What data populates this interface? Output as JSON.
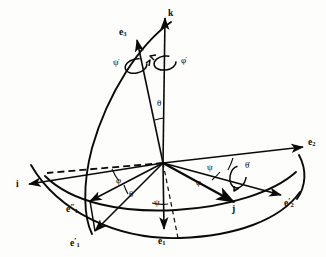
{
  "figure": {
    "background_color": "#fdfdfb",
    "ink_color": "#0a0a0a"
  },
  "labels": {
    "k": {
      "text": "k",
      "sub": ""
    },
    "e3": {
      "text": "e",
      "sub": "3"
    },
    "e2": {
      "text": "e",
      "sub": "2"
    },
    "e1": {
      "text": "e",
      "sub": "1"
    },
    "e1_prime": {
      "text": "e",
      "prime": "′",
      "sub": "1"
    },
    "e1_dprime": {
      "text": "e",
      "prime": "″",
      "sub": "1"
    },
    "e2_prime": {
      "text": "e",
      "prime": "′",
      "sub": "2"
    },
    "i": {
      "text": "i",
      "sub": ""
    },
    "j": {
      "text": "j",
      "sub": ""
    }
  },
  "angles": {
    "theta_upper": "θ",
    "theta_lower": "θ",
    "psi_center": "ψ",
    "psi_right": "ψ",
    "phi_left": "φ",
    "phi_right": "φ"
  },
  "rates": {
    "psi_dot": "ψ̇",
    "phi_dot": "φ̇",
    "theta_dot": "θ̇"
  },
  "geometry": {
    "origin": {
      "x": 163,
      "y": 163
    },
    "vector_tips": {
      "k": {
        "x": 165,
        "y": 15
      },
      "e3": {
        "x": 136,
        "y": 37
      },
      "e2": {
        "x": 305,
        "y": 146
      },
      "e1": {
        "x": 164,
        "y": 231
      },
      "i": {
        "x": 26,
        "y": 185
      },
      "j": {
        "x": 236,
        "y": 203
      },
      "e1_prime": {
        "x": 92,
        "y": 233
      },
      "e1_dprime": {
        "x": 88,
        "y": 202
      },
      "e2_prime": {
        "x": 283,
        "y": 196
      }
    }
  }
}
